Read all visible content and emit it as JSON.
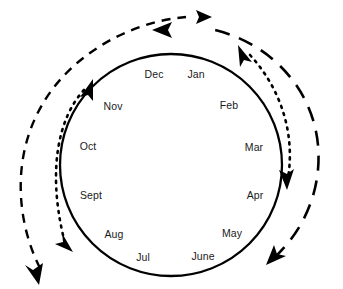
{
  "figure": {
    "type": "cycle-diagram",
    "background_color": "#ffffff",
    "stroke_color": "#000000",
    "text_color": "#1a1a1a"
  },
  "cycle": {
    "name": "calendar-month-ring",
    "center_x": 171,
    "center_y": 165,
    "radius": 111,
    "stroke_width": 2.2,
    "months": [
      {
        "label": "Jan",
        "x": 196,
        "y": 74
      },
      {
        "label": "Feb",
        "x": 229,
        "y": 105
      },
      {
        "label": "Mar",
        "x": 254,
        "y": 147
      },
      {
        "label": "Apr",
        "x": 255,
        "y": 195
      },
      {
        "label": "May",
        "x": 232,
        "y": 233
      },
      {
        "label": "June",
        "x": 203,
        "y": 256
      },
      {
        "label": "Jul",
        "x": 143,
        "y": 257
      },
      {
        "label": "Aug",
        "x": 114,
        "y": 234
      },
      {
        "label": "Sept",
        "x": 91,
        "y": 195
      },
      {
        "label": "Oct",
        "x": 88,
        "y": 146
      },
      {
        "label": "Nov",
        "x": 113,
        "y": 106
      },
      {
        "label": "Dec",
        "x": 154,
        "y": 74
      }
    ]
  },
  "arrows": {
    "outer_short_dash_arc": {
      "name": "outer-left-dashed-arc",
      "dash_pattern": "9 7",
      "head": "arrow-right-top",
      "direction": "clockwise",
      "second_head": "arrow-down-bottom-left"
    },
    "outer_long_dash_arc": {
      "name": "outer-right-long-dashed-arc",
      "dash_pattern": "15 10",
      "head": "arrow-left-top",
      "direction": "counter-clockwise",
      "second_head": "arrow-down-left-bottom-right"
    },
    "left_dotted_arc": {
      "name": "left-dotted-double-arrow",
      "dash_pattern": "2 5",
      "head_start": "arrow-up",
      "head_end": "arrow-down",
      "direction": "bidirectional"
    },
    "right_dotted_arc": {
      "name": "right-dotted-double-arrow",
      "dash_pattern": "2 5",
      "head_start": "arrow-up-left",
      "head_end": "arrow-down",
      "direction": "bidirectional"
    }
  },
  "caption": {
    "text": ""
  }
}
